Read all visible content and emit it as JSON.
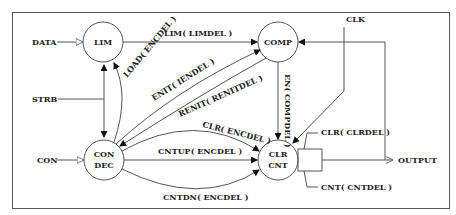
{
  "diagram": {
    "nodes": {
      "lim": {
        "label": "LIM"
      },
      "comp": {
        "label": "COMP"
      },
      "condec": {
        "line1": "CON",
        "line2": "DEC"
      },
      "clrcnt": {
        "line1": "CLR",
        "line2": "CNT"
      }
    },
    "inputs": {
      "data": "DATA",
      "strb": "STRB",
      "con": "CON",
      "clk": "CLK"
    },
    "output": "OUTPUT",
    "edges": {
      "lim_to_comp": "LIM( LIMDEL )",
      "load": "LOAD( ENCDEL )",
      "enit": "ENIT( IENDEL )",
      "renit": "RENIT( RENITDEL )",
      "clr_encdel": "CLR( ENCDEL )",
      "cntup": "CNTUP( ENCDEL )",
      "cntdn": "CNTDN( ENCDEL )",
      "en_compdel": "EN( COMPDEL )",
      "clr_clrdel": "CLR( CLRDEL )",
      "cnt_cntdel": "CNT( CNTDEL )"
    },
    "colors": {
      "line": "#555555",
      "text": "#222222",
      "background": "#ffffff"
    }
  }
}
